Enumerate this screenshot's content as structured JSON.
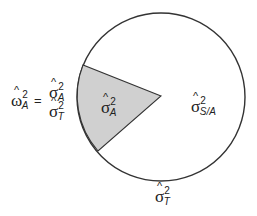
{
  "diagram": {
    "type": "variance-partition-pie",
    "colors": {
      "circle_stroke": "#333333",
      "wedge_fill": "#d0d0d0",
      "background": "#ffffff"
    },
    "circle": {
      "cx": 161,
      "cy": 97,
      "r": 84
    },
    "wedge": {
      "vertex": [
        161,
        96
      ],
      "p1": [
        83,
        65
      ],
      "p2": [
        98,
        151
      ]
    },
    "labels": {
      "omega": {
        "hat": "^",
        "base": "ω",
        "sup": "2",
        "sub": "A"
      },
      "equals": "=",
      "fraction_num": {
        "hat": "^",
        "base": "σ",
        "sup": "2",
        "sub": "A"
      },
      "fraction_den": {
        "hat": "^",
        "base": "σ",
        "sup": "2",
        "sub": "T"
      },
      "wedge_label": {
        "hat": "^",
        "base": "σ",
        "sup": "2",
        "sub": "A"
      },
      "remainder_label": {
        "hat": "^",
        "base": "σ",
        "sup": "2",
        "sub": "S/A"
      },
      "total_label": {
        "hat": "^",
        "base": "σ",
        "sup": "2",
        "sub": "T"
      }
    }
  }
}
